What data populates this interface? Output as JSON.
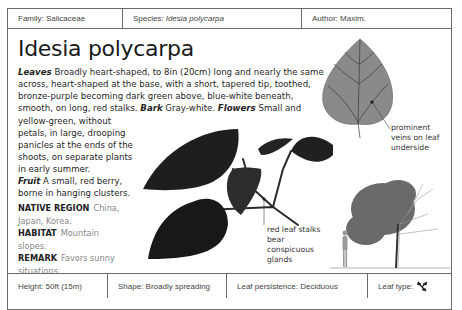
{
  "header": {
    "family_label": "Family:",
    "family_value": "Salicaceae",
    "species_label": "Species:",
    "species_value": "Idesia polycarpa",
    "author_label": "Author:",
    "author_value": "Maxim."
  },
  "title": "Idesia polycarpa",
  "description": {
    "leaves_label": "Leaves",
    "leaves_text": " Broadly heart-shaped, to 8in (20cm) long and nearly the same across, heart-shaped at the base, with a short, tapered tip, toothed, bronze-purple becoming dark green above, blue-white beneath, smooth, on long, red stalks. ",
    "bark_label": "Bark",
    "bark_text": " Gray-white. ",
    "flowers_label": "Flowers",
    "flowers_text_1": " Small and",
    "flowers_text_2": "yellow-green, without petals, in large, drooping panicles at the ends of the shoots, on separate plants in early summer.",
    "fruit_label": "Fruit",
    "fruit_text": " A small, red berry, borne in hanging clusters."
  },
  "facts": {
    "native_region_label": "NATIVE REGION",
    "native_region_value": "China, Japan, Korea.",
    "habitat_label": "HABITAT",
    "habitat_value": "Mountain slopes.",
    "remark_label": "REMARK",
    "remark_value": "Favors sunny situations."
  },
  "annotations": {
    "leaf_underside": "prominent veins on leaf underside",
    "leaf_stalks": "red leaf stalks bear conspicuous glands"
  },
  "footer": {
    "height": "Height: 50ft (15m)",
    "shape": "Shape: Broadly spreading",
    "leaf_persistence": "Leaf persistence: Deciduous",
    "leaf_type_label": "Leaf type:",
    "leaf_type_icon": "simple-leaf-icon"
  },
  "colors": {
    "border": "#6b6b6b",
    "leaf_dark": "#1c1c1c",
    "leaf_underside": "#8a8a8a"
  }
}
